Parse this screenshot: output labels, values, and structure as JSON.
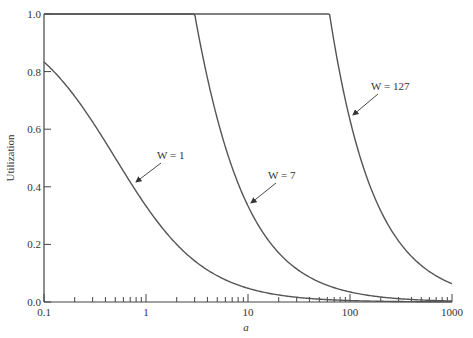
{
  "chart_data": {
    "type": "line",
    "title": "",
    "xlabel": "a",
    "ylabel": "Utilization",
    "xscale": "log",
    "xlim": [
      0.1,
      1000
    ],
    "ylim": [
      0.0,
      1.0
    ],
    "grid": false,
    "legend": "inline annotations with arrows",
    "x_ticks": [
      "0.1",
      "1",
      "10",
      "100",
      "1000"
    ],
    "y_ticks": [
      "0.0",
      "0.2",
      "0.4",
      "0.6",
      "0.8",
      "1.0"
    ],
    "x": [
      0.1,
      0.2,
      0.5,
      1,
      2,
      3,
      5,
      10,
      20,
      50,
      63,
      100,
      200,
      500,
      1000
    ],
    "series": [
      {
        "name": "W = 1",
        "values": [
          0.83,
          0.71,
          0.5,
          0.33,
          0.2,
          0.14,
          0.09,
          0.05,
          0.02,
          0.01,
          0.01,
          0.0,
          0.0,
          0.0,
          0.0
        ]
      },
      {
        "name": "W = 7",
        "values": [
          1.0,
          1.0,
          1.0,
          1.0,
          1.0,
          1.0,
          0.64,
          0.33,
          0.17,
          0.07,
          0.06,
          0.03,
          0.02,
          0.01,
          0.0
        ]
      },
      {
        "name": "W = 127",
        "values": [
          1.0,
          1.0,
          1.0,
          1.0,
          1.0,
          1.0,
          1.0,
          1.0,
          1.0,
          1.0,
          1.0,
          0.63,
          0.32,
          0.13,
          0.06
        ]
      }
    ],
    "annotations": [
      {
        "text": "W = 1",
        "points_to_a": 0.7
      },
      {
        "text": "W = 7",
        "points_to_a": 6
      },
      {
        "text": "W = 127",
        "points_to_a": 110
      }
    ]
  },
  "labels": {
    "ylabel": "Utilization",
    "xlabel": "a",
    "w1": "W = 1",
    "w7": "W = 7",
    "w127": "W = 127",
    "x_ticks": [
      "0.1",
      "1",
      "10",
      "100",
      "1000"
    ],
    "y_ticks": [
      "0.0",
      "0.2",
      "0.4",
      "0.6",
      "0.8",
      "1.0"
    ]
  }
}
